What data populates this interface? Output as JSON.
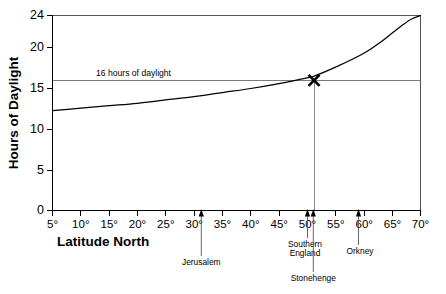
{
  "chart_data": {
    "type": "line",
    "title": "",
    "xlabel": "Latitude North",
    "ylabel": "Hours of Daylight",
    "xlim": [
      5,
      70
    ],
    "ylim": [
      0,
      24
    ],
    "grid": false,
    "legend_position": "none",
    "x_tick_values": [
      5,
      10,
      15,
      20,
      25,
      30,
      35,
      40,
      45,
      50,
      55,
      60,
      65,
      70
    ],
    "x_tick_labels": [
      "5°",
      "10°",
      "15°",
      "20°",
      "25°",
      "30°",
      "35°",
      "40°",
      "45°",
      "50°",
      "55°",
      "60°",
      "65°",
      "70°"
    ],
    "y_tick_values": [
      0,
      5,
      10,
      15,
      20,
      24
    ],
    "y_tick_labels": [
      "0",
      "5",
      "10",
      "15",
      "20",
      "24"
    ],
    "series": [
      {
        "name": "Hours of daylight at summer solstice",
        "x": [
          5,
          10,
          15,
          20,
          25,
          30,
          35,
          40,
          45,
          50,
          51.2,
          55,
          60,
          63,
          65,
          67,
          68.5,
          70
        ],
        "values": [
          12.3,
          12.6,
          12.9,
          13.2,
          13.6,
          14.0,
          14.5,
          15.0,
          15.6,
          16.3,
          16.5,
          17.6,
          19.3,
          20.7,
          21.8,
          22.9,
          23.6,
          24.0
        ]
      }
    ],
    "reference_line": {
      "label": "16 hours of daylight",
      "value": 16,
      "orientation": "horizontal"
    },
    "marker": {
      "symbol": "X",
      "x": 51.2,
      "y": 16,
      "description": "Stonehenge reaches 16 hours of daylight"
    },
    "drop_line": {
      "x": 51.2,
      "from_y": 0,
      "to_y": 16
    },
    "annotations": [
      {
        "label": "Jerusalem",
        "x": 31.5,
        "label_line": 1,
        "row": 2
      },
      {
        "label": "Southern",
        "label2": "England",
        "x": 50.0,
        "label_line": 2,
        "row": 1
      },
      {
        "label": "Stonehenge",
        "x": 51.2,
        "label_line": 1,
        "row": 2
      },
      {
        "label": "Orkney",
        "x": 59.0,
        "label_line": 1,
        "row": 1
      }
    ]
  },
  "labels": {
    "y_axis_title": "Hours of Daylight",
    "x_axis_title": "Latitude North",
    "reference_text": "16 hours of daylight",
    "marker_symbol": "X",
    "jerusalem": "Jerusalem",
    "southern_england_l1": "Southern",
    "southern_england_l2": "England",
    "stonehenge": "Stonehenge",
    "orkney": "Orkney",
    "ytick_0": "0",
    "ytick_5": "5",
    "ytick_10": "10",
    "ytick_15": "15",
    "ytick_20": "20",
    "ytick_24": "24",
    "xtick_5": "5°",
    "xtick_10": "10°",
    "xtick_15": "15°",
    "xtick_20": "20°",
    "xtick_25": "25°",
    "xtick_30": "30°",
    "xtick_35": "35°",
    "xtick_40": "40°",
    "xtick_45": "45°",
    "xtick_50": "50°",
    "xtick_55": "55°",
    "xtick_60": "60°",
    "xtick_65": "65°",
    "xtick_70": "70°"
  },
  "colors": {
    "background": "#ffffff",
    "axis": "#000000",
    "curve": "#000000",
    "reference_line": "#7a7a7a",
    "drop_line": "#8a8a8a",
    "annotation": "#555555"
  }
}
